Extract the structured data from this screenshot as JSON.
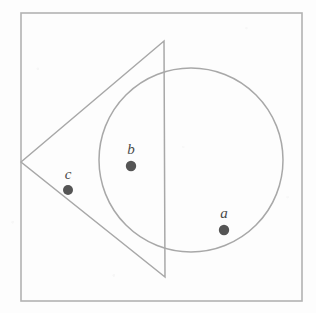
{
  "figure": {
    "background_color": "#fdfdfd",
    "stroke_color": "#a8a8a8",
    "border_color": "#b2b2b2",
    "dot_color": "#555555",
    "label_color": "#4a4a4a",
    "frame": {
      "name": "bounding-square",
      "x": 21,
      "y": 13,
      "width": 281,
      "height": 288,
      "stroke_width": 1.6
    },
    "triangle": {
      "name": "triangle",
      "points": "21,162 164,41 165,277",
      "vertices": [
        {
          "label": "apex-left",
          "x": 21,
          "y": 162
        },
        {
          "label": "vertex-top",
          "x": 164,
          "y": 41
        },
        {
          "label": "vertex-bottom",
          "x": 165,
          "y": 277
        }
      ],
      "stroke_width": 1.5
    },
    "circle": {
      "name": "circle",
      "cx": 191,
      "cy": 160,
      "r": 92,
      "stroke_width": 1.5
    },
    "points": [
      {
        "id": "a",
        "label": "a",
        "cx": 224,
        "cy": 230,
        "r": 5.2,
        "label_x": 224,
        "label_y": 218
      },
      {
        "id": "b",
        "label": "b",
        "cx": 131,
        "cy": 166,
        "r": 5.2,
        "label_x": 131,
        "label_y": 154
      },
      {
        "id": "c",
        "label": "c",
        "cx": 68,
        "cy": 190,
        "r": 5.0,
        "label_x": 68,
        "label_y": 179
      }
    ]
  }
}
